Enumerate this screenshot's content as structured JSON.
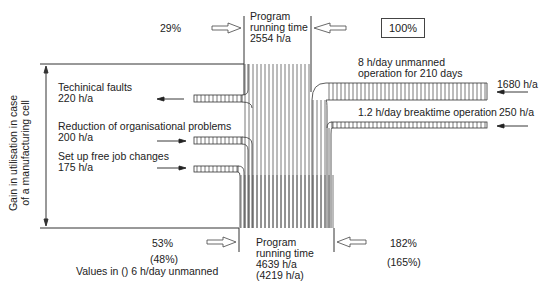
{
  "diagram": {
    "type": "sankey-flow",
    "top": {
      "left_percent": "29%",
      "program_label_line1": "Program",
      "program_label_line2": "running time",
      "program_value": "2554 h/a",
      "reference_box": "100%"
    },
    "axis_label_line1": "Gain in utilisation in case",
    "axis_label_line2": "of a manufacturing cell",
    "left_inputs": [
      {
        "label": "Techinical faults",
        "value": "220 h/a"
      },
      {
        "label": "Reduction of organisational problems",
        "value": "200 h/a"
      },
      {
        "label": "Set up free job changes",
        "value": "175 h/a"
      }
    ],
    "right_inputs": [
      {
        "label_line1": "8 h/day unmanned",
        "label_line2": "operation for 210 days",
        "value": "1680 h/a"
      },
      {
        "label": "1.2 h/day breaktime operation",
        "value": "250 h/a"
      }
    ],
    "bottom": {
      "left_percent": "53%",
      "left_percent_alt": "(48%)",
      "program_label_line1": "Program",
      "program_label_line2": "running time",
      "program_value": "4639 h/a",
      "program_value_alt": "(4219 h/a)",
      "right_percent": "182%",
      "right_percent_alt": "(165%)",
      "footnote": "Values in () 6 h/day unmanned"
    },
    "colors": {
      "line": "#333333",
      "hatch": "#555555",
      "arrow_fill": "#ffffff"
    }
  }
}
